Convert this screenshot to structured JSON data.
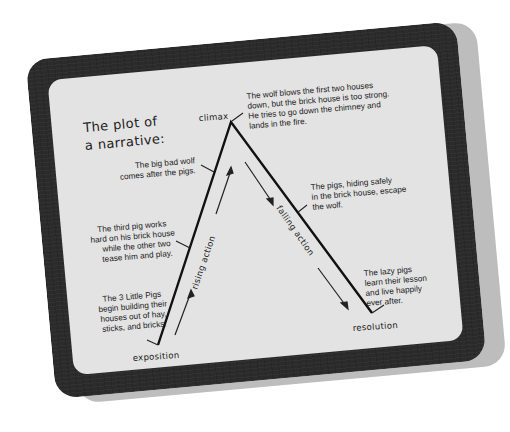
{
  "title": {
    "line1": "The plot of",
    "line2": "a narrative:"
  },
  "stages": {
    "exposition": "exposition",
    "rising_action": "rising action",
    "climax": "climax",
    "falling_action": "falling action",
    "resolution": "resolution"
  },
  "notes": {
    "exposition": [
      "The 3 Little Pigs",
      "begin building their",
      "houses out of hay,",
      "sticks, and bricks."
    ],
    "rising_1": [
      "The third pig works",
      "hard on his brick house",
      "while the other two",
      "tease him and play."
    ],
    "rising_2": [
      "The big bad wolf",
      "comes after the pigs."
    ],
    "climax": [
      "The wolf blows the first two houses",
      "down, but the brick house is too strong.",
      "He tries to go down the chimney and",
      "lands in the fire."
    ],
    "falling": [
      "The pigs, hiding safely",
      "in the brick house, escape",
      "the wolf."
    ],
    "resolution": [
      "The lazy pigs",
      "learn their lesson",
      "and live happily",
      "ever after."
    ]
  },
  "colors": {
    "board": "#2b2b2b",
    "panel": "#e3e3e3",
    "shadow": "#bdbdbd",
    "ink": "#1c1c1c"
  }
}
